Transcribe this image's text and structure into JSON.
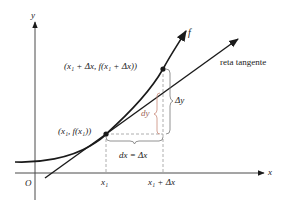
{
  "diagram": {
    "axes": {
      "x_label": "x",
      "y_label": "y",
      "origin_label": "O"
    },
    "curve": {
      "label": "f",
      "color": "#1a1a1a"
    },
    "tangent": {
      "label": "reta tangente",
      "color": "#1a1a1a"
    },
    "points": [
      {
        "label": "(x₁, f(x₁))"
      },
      {
        "label": "(x₁ + Δx, f(x₁ + Δx))"
      }
    ],
    "ticks": {
      "x1": "x₁",
      "x1_plus_dx": "x₁ + Δx"
    },
    "braces": {
      "dx": "dx = Δx",
      "dy": "dy",
      "delta_y": "Δy"
    },
    "colors": {
      "ink": "#1a1a1a",
      "dashed": "#9a9a9a",
      "dy_brace": "#c98a7a",
      "dy_label": "#a0665a"
    }
  }
}
